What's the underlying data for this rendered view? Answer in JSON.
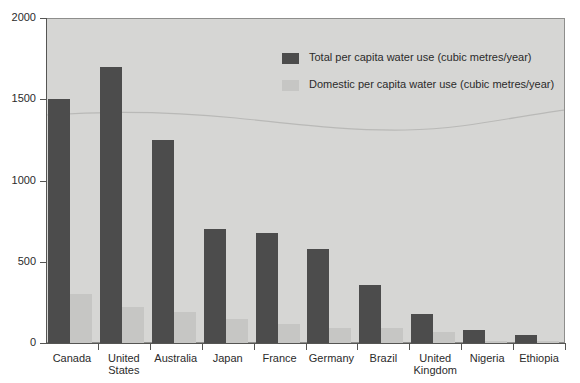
{
  "chart_data": {
    "type": "bar",
    "title": "",
    "xlabel": "",
    "ylabel": "",
    "ylim": [
      0,
      2000
    ],
    "yticks": [
      0,
      500,
      1000,
      1500,
      2000
    ],
    "ytick_labels": [
      "0",
      "500",
      "1000",
      "1500",
      "2000"
    ],
    "grid": false,
    "legend_position": "top-center-right",
    "categories": [
      "Canada",
      "United\nStates",
      "Australia",
      "Japan",
      "France",
      "Germany",
      "Brazil",
      "United\nKingdom",
      "Nigeria",
      "Ethiopia"
    ],
    "series": [
      {
        "name": "Total per capita water use (cubic metres/year)",
        "color": "#4c4c4c",
        "values": [
          1500,
          1700,
          1250,
          700,
          680,
          580,
          360,
          180,
          80,
          50
        ]
      },
      {
        "name": "Domestic per capita water use (cubic metres/year)",
        "color": "#c6c6c4",
        "values": [
          300,
          220,
          190,
          150,
          120,
          90,
          90,
          70,
          15,
          12
        ]
      }
    ]
  },
  "legend": {
    "items": [
      {
        "label": "Total per capita water use (cubic metres/year)",
        "swatch": "total"
      },
      {
        "label": "Domestic per capita water use (cubic metres/year)",
        "swatch": "domestic"
      }
    ]
  },
  "colors": {
    "bar_total": "#4c4c4c",
    "bar_domestic": "#c6c6c4",
    "plot_background": "#d6d6d4",
    "axis": "#555553",
    "text": "#2b2b2b",
    "page_background": "#ffffff"
  }
}
